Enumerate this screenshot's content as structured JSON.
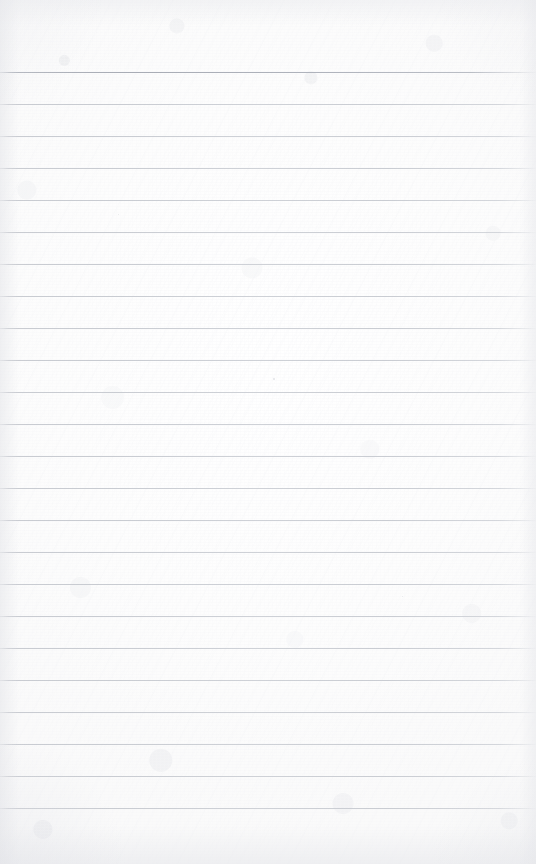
{
  "document": {
    "kind": "scanned-lined-notebook-paper",
    "title": "Blank Lined Paper",
    "page_width": 536,
    "page_height": 864,
    "has_text_content": false,
    "visible_text": "",
    "orientation": "portrait"
  },
  "paper": {
    "background_color": "#fdfdfd",
    "base_white": "#ffffff",
    "texture_tint": "#f2f3f5",
    "edge_shadow_color": "#e4e5e9"
  },
  "ruling": {
    "line_color": "#cacdd3",
    "first_line_color": "#aeb2bb",
    "line_thickness_px": 1,
    "line_spacing_px": 32,
    "first_line_y": 72,
    "last_line_y": 808,
    "line_count": 24,
    "left_inset_px": 0,
    "right_inset_px": 0,
    "top_margin_px": 72,
    "bottom_margin_px": 56,
    "lines_y": [
      72,
      104,
      136,
      168,
      200,
      232,
      264,
      296,
      328,
      360,
      392,
      424,
      456,
      488,
      520,
      552,
      584,
      616,
      648,
      680,
      712,
      744,
      776,
      808
    ]
  },
  "artifacts": {
    "specks": [
      {
        "x": 273,
        "y": 378,
        "size": 2,
        "color": "#e2e3e7"
      },
      {
        "x": 118,
        "y": 214,
        "size": 1,
        "color": "#e6e7ea"
      },
      {
        "x": 402,
        "y": 596,
        "size": 1,
        "color": "#e5e6ea"
      }
    ]
  }
}
